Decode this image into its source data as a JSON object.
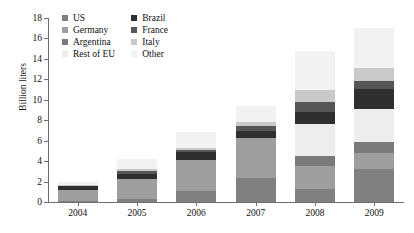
{
  "chart_data": {
    "type": "bar",
    "stacked": true,
    "title": "",
    "xlabel": "",
    "ylabel": "Billion liters",
    "categories": [
      "2004",
      "2005",
      "2006",
      "2007",
      "2008",
      "2009"
    ],
    "ylim": [
      0,
      18
    ],
    "yticks": [
      0,
      2,
      4,
      6,
      8,
      10,
      12,
      14,
      16,
      18
    ],
    "grid": false,
    "legend_position": "top-left",
    "series": [
      {
        "name": "US",
        "color": "#808080",
        "values": [
          0.05,
          0.3,
          1.1,
          2.3,
          1.25,
          3.2
        ]
      },
      {
        "name": "Germany",
        "color": "#9e9e9e",
        "values": [
          1.15,
          1.95,
          3.05,
          3.95,
          2.3,
          1.55
        ]
      },
      {
        "name": "Argentina",
        "color": "#7a7a7a",
        "values": [
          0.0,
          0.0,
          0.0,
          0.0,
          0.95,
          1.1
        ]
      },
      {
        "name": "Rest of EU",
        "color": "#ededed",
        "values": [
          0.0,
          0.0,
          0.0,
          0.0,
          3.1,
          3.25
        ]
      },
      {
        "name": "Brazil",
        "color": "#2f2f2f",
        "values": [
          0.4,
          0.5,
          0.75,
          0.7,
          1.25,
          2.0
        ]
      },
      {
        "name": "France",
        "color": "#565656",
        "values": [
          0.05,
          0.3,
          0.15,
          0.45,
          0.95,
          0.7
        ]
      },
      {
        "name": "Italy",
        "color": "#c9c9c9",
        "values": [
          0.05,
          0.2,
          0.2,
          0.45,
          1.2,
          1.3
        ]
      },
      {
        "name": "Other",
        "color": "#f2f2f2",
        "values": [
          0.3,
          1.0,
          1.55,
          1.55,
          3.75,
          3.9
        ]
      }
    ],
    "totals": [
      2.0,
      4.25,
      6.8,
      9.4,
      14.75,
      17.0
    ]
  },
  "legend": {
    "entries": [
      {
        "label": "US",
        "swatch": "legend-swatch-us"
      },
      {
        "label": "Brazil",
        "swatch": "legend-swatch-brazil"
      },
      {
        "label": "Germany",
        "swatch": "legend-swatch-germany"
      },
      {
        "label": "France",
        "swatch": "legend-swatch-france"
      },
      {
        "label": "Argentina",
        "swatch": "legend-swatch-argentina"
      },
      {
        "label": "Italy",
        "swatch": "legend-swatch-italy"
      },
      {
        "label": "Rest of EU",
        "swatch": "legend-swatch-rest-of-eu"
      },
      {
        "label": "Other",
        "swatch": "legend-swatch-other"
      }
    ]
  },
  "axes": {
    "y_label": "Billion liters"
  }
}
